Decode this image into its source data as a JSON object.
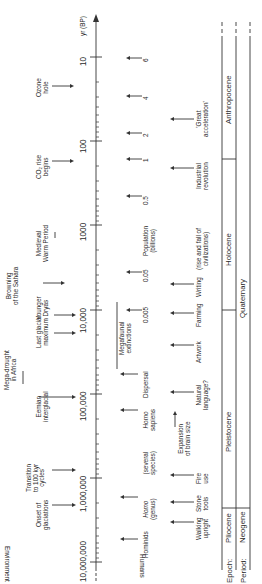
{
  "figure": {
    "orientation": "rotated-90-ccw",
    "axis": {
      "label": "yr (BP)",
      "scale": "log",
      "ticks": [
        "10",
        "100",
        "1000",
        "10,000",
        "100,000",
        "1,000,000",
        "10,000,000"
      ]
    },
    "row_labels": {
      "environment": "Environment",
      "humans": "Humans",
      "epoch": "Epoch:",
      "period": "Period:"
    },
    "environment_events": [
      {
        "id": "ozone",
        "line1": "Ozone",
        "line2": "hole"
      },
      {
        "id": "co2",
        "line1": "CO₂ rise",
        "line2": "begins"
      },
      {
        "id": "mwp",
        "line1": "Medieval",
        "line2": "Warm Period"
      },
      {
        "id": "sahara",
        "line1": "Browning",
        "line2": "of the Sahara"
      },
      {
        "id": "yd",
        "line1": "Younger",
        "line2": "Dryas"
      },
      {
        "id": "lgm",
        "line1": "Last glacial",
        "line2": "maximum"
      },
      {
        "id": "mega",
        "line1": "Mega-drought",
        "line2": "in Africa"
      },
      {
        "id": "eemian",
        "line1": "Eemian",
        "line2": "interglacial"
      },
      {
        "id": "transition",
        "line1": "Transition",
        "line2": "to 100 kyr",
        "line3": "cycles"
      },
      {
        "id": "onset",
        "line1": "Onset of",
        "line2": "glaciations"
      }
    ],
    "population": {
      "label1": "Population",
      "label2": "(billions)",
      "values": [
        "6",
        "4",
        "2",
        "1",
        "0.5",
        "0.05",
        "0.005"
      ]
    },
    "human_species": [
      {
        "id": "megafauna",
        "line1": "Megafaunal",
        "line2": "extinctions"
      },
      {
        "id": "dispersal",
        "line1": "Dispersal",
        "line2": ""
      },
      {
        "id": "sapiens",
        "line1": "Homo",
        "line2": "sapiens"
      },
      {
        "id": "several",
        "line1": "(several",
        "line2": "species)"
      },
      {
        "id": "genus",
        "line1": "Homo",
        "line2": "(genus)"
      },
      {
        "id": "hominids",
        "line1": "Hominids",
        "line2": ""
      }
    ],
    "human_culture": [
      {
        "id": "great",
        "line1": "'Great",
        "line2": "acceleration'"
      },
      {
        "id": "industrial",
        "line1": "Industrial",
        "line2": "revolution"
      },
      {
        "id": "civil",
        "line1": "(rise and fall of",
        "line2": "civilizations)"
      },
      {
        "id": "writing",
        "line1": "Writing",
        "line2": ""
      },
      {
        "id": "farming",
        "line1": "Farming",
        "line2": ""
      },
      {
        "id": "artwork",
        "line1": "Artwork",
        "line2": ""
      },
      {
        "id": "language",
        "line1": "Natural",
        "line2": "language?"
      },
      {
        "id": "brain",
        "line1": "Expansion",
        "line2": "of brain size"
      },
      {
        "id": "fire",
        "line1": "Fire",
        "line2": "use"
      },
      {
        "id": "stone",
        "line1": "Stone",
        "line2": "tools"
      },
      {
        "id": "walking",
        "line1": "Walking",
        "line2": "upright"
      }
    ],
    "epochs": [
      "Anthropocene",
      "Holocene",
      "Pleistocene",
      "Pliocene"
    ],
    "periods": [
      "Quaternary",
      "Neogene"
    ]
  }
}
